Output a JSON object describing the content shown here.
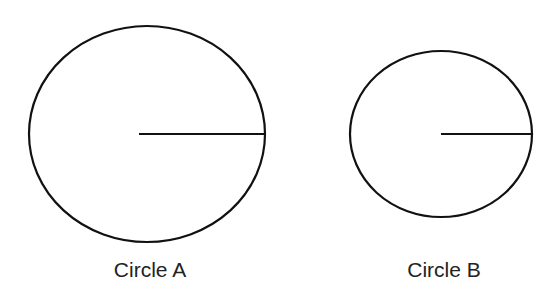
{
  "diagram": {
    "circles": [
      {
        "id": "A",
        "label": "Circle A",
        "cx": 147,
        "cy": 134,
        "rx": 118,
        "ry": 108,
        "radius_start": 139
      },
      {
        "id": "B",
        "label": "Circle B",
        "cx": 441,
        "cy": 134,
        "rx": 91,
        "ry": 83,
        "radius_start": 441
      }
    ],
    "stroke_color": "#111111"
  }
}
